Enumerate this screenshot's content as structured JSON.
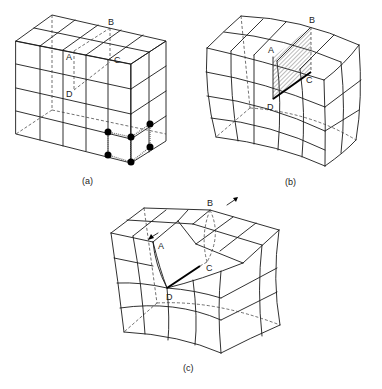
{
  "figure": {
    "panels": [
      {
        "id": "a",
        "caption": "(a)",
        "description": "Undeformed cubic lattice block with grid of cells; dashed plane ABCD inside; atoms connected by springs at lower-right corner",
        "points": {
          "A": "A",
          "B": "B",
          "C": "C",
          "D": "D"
        }
      },
      {
        "id": "b",
        "caption": "(b)",
        "description": "Block bent into a curved shape; plane ABCD shaded with hatching; DC edge drawn bold (edge dislocation line)",
        "points": {
          "A": "A",
          "B": "B",
          "C": "C",
          "D": "D"
        }
      },
      {
        "id": "c",
        "caption": "(c)",
        "description": "Block cut along ABCD and displaced; arrows at A and B show opposite displacement directions; DC bold (dislocation line)",
        "points": {
          "A": "A",
          "B": "B",
          "C": "C",
          "D": "D"
        }
      }
    ],
    "colors": {
      "line": "#1a1a1a",
      "hatch": "#555555",
      "background": "#ffffff"
    }
  }
}
